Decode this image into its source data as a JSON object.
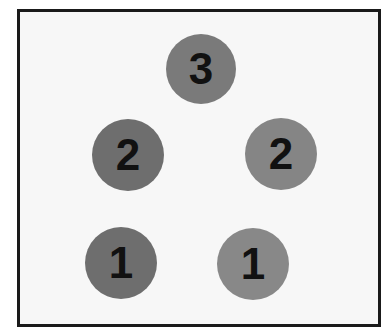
{
  "diagram": {
    "frame_color": "#1a1a1a",
    "background_color": "#f7f7f7",
    "node_color": "#7f7f7f",
    "label_color": "#111111",
    "nodes": [
      {
        "label": "3",
        "cx": 201,
        "cy": 69,
        "r": 35
      },
      {
        "label": "2",
        "cx": 128,
        "cy": 155,
        "r": 36
      },
      {
        "label": "2",
        "cx": 281,
        "cy": 154,
        "r": 36
      },
      {
        "label": "1",
        "cx": 121,
        "cy": 263,
        "r": 36
      },
      {
        "label": "1",
        "cx": 253,
        "cy": 264,
        "r": 36
      }
    ]
  }
}
